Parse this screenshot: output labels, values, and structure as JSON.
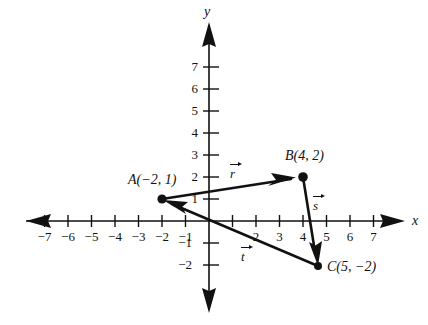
{
  "figure": {
    "axes": {
      "x_axis_label": "x",
      "y_axis_label": "y",
      "x_ticks": [
        -7,
        -6,
        -5,
        -4,
        -3,
        -2,
        -1,
        1,
        2,
        3,
        4,
        5,
        6,
        7
      ],
      "y_ticks": [
        -2,
        -1,
        1,
        2,
        3,
        4,
        5,
        6,
        7
      ],
      "x_tick_labels": [
        "−7",
        "−6",
        "−5",
        "−4",
        "−3",
        "−2",
        "−1",
        "2",
        "3",
        "4",
        "5",
        "6",
        "7"
      ],
      "y_tick_labels": [
        "7",
        "6",
        "5",
        "4",
        "3",
        "2",
        "1",
        "−1",
        "−2"
      ],
      "xlim": [
        -8.3,
        8.3
      ],
      "ylim": [
        -3.2,
        8.6
      ],
      "grid": false,
      "tick_interval": 1
    },
    "points": [
      {
        "name": "A",
        "label": "A(−2, 1)",
        "letter": "A",
        "coords": "(−2, 1)",
        "x": -2,
        "y": 1
      },
      {
        "name": "B",
        "label": "B(4, 2)",
        "letter": "B",
        "coords": "(4, 2)",
        "x": 4,
        "y": 2
      },
      {
        "name": "C",
        "label": "C(5, −2)",
        "letter": "C",
        "coords": "(5, −2)",
        "x": 5,
        "y": -2
      }
    ],
    "vectors": [
      {
        "name": "r",
        "label": "r",
        "from": "A",
        "to": "B",
        "from_xy": [
          -2,
          1
        ],
        "to_xy": [
          4,
          2
        ],
        "components": [
          6,
          1
        ]
      },
      {
        "name": "s",
        "label": "s",
        "from": "B",
        "to": "C",
        "from_xy": [
          4,
          2
        ],
        "to_xy": [
          5,
          -2
        ],
        "components": [
          1,
          -4
        ]
      },
      {
        "name": "t",
        "label": "t",
        "from": "C",
        "to": "A",
        "from_xy": [
          5,
          -2
        ],
        "to_xy": [
          -2,
          1
        ],
        "components": [
          -7,
          3
        ]
      }
    ],
    "colors": {
      "ink": "#111111",
      "background": "#ffffff"
    }
  }
}
